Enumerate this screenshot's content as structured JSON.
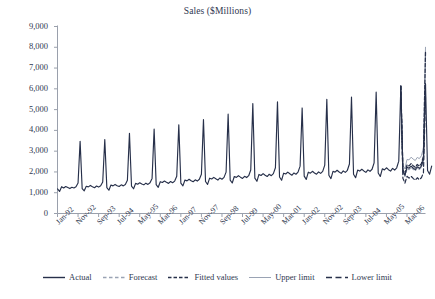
{
  "chart_data": {
    "type": "line",
    "title": "Sales ($Millions)",
    "xlabel": "",
    "ylabel": "",
    "ylim": [
      0,
      9000
    ],
    "ytick_step": 1000,
    "grid": false,
    "legend_position": "bottom",
    "yticks": [
      "0",
      "1,000",
      "2,000",
      "3,000",
      "4,000",
      "5,000",
      "6,000",
      "7,000",
      "8,000",
      "9,000"
    ],
    "ytick_values": [
      0,
      1000,
      2000,
      3000,
      4000,
      5000,
      6000,
      7000,
      8000,
      9000
    ],
    "xticks": [
      "Jan-92",
      "Nov-92",
      "Sep-93",
      "Jul-94",
      "May-95",
      "Mar-96",
      "Jan-97",
      "Nov-97",
      "Sep-98",
      "Jul-99",
      "May-00",
      "Mar-01",
      "Jan-02",
      "Nov-02",
      "Sep-03",
      "Jul-04",
      "May-05",
      "Mar-06"
    ],
    "xtick_indices": [
      0,
      10,
      20,
      30,
      40,
      50,
      60,
      70,
      80,
      90,
      100,
      110,
      120,
      130,
      140,
      150,
      160,
      170
    ],
    "x_start_label": "Jan-92",
    "x_end_label": "Mar-06",
    "forecast_start_index": 168,
    "n_points": 180,
    "colors": {
      "actual": "#27304a",
      "forecast": "#9aa3b4",
      "fitted": "#27304a",
      "upper_limit": "#9aa3b4",
      "lower_limit": "#27304a",
      "axis": "#9aa0ac",
      "text": "#2f3850",
      "background": "#ffffff"
    },
    "legend": [
      {
        "label": "Actual",
        "style": "solid",
        "color": "#27304a",
        "width": 1.4
      },
      {
        "label": "Forecast",
        "style": "dashed-light",
        "color": "#9aa3b4",
        "width": 1.3
      },
      {
        "label": "Fitted values",
        "style": "dashed-dark",
        "color": "#27304a",
        "width": 1.6
      },
      {
        "label": "Upper limit",
        "style": "solid-light",
        "color": "#9aa3b4",
        "width": 1.0
      },
      {
        "label": "Lower limit",
        "style": "dashed-long",
        "color": "#27304a",
        "width": 1.6
      }
    ],
    "series": [
      {
        "name": "Actual",
        "values": [
          1180,
          1060,
          1290,
          1230,
          1300,
          1250,
          1200,
          1260,
          1230,
          1290,
          1470,
          3470,
          1200,
          1090,
          1310,
          1280,
          1350,
          1290,
          1240,
          1320,
          1270,
          1340,
          1520,
          3560,
          1250,
          1120,
          1370,
          1330,
          1400,
          1340,
          1300,
          1380,
          1330,
          1400,
          1600,
          3860,
          1320,
          1190,
          1450,
          1410,
          1480,
          1420,
          1380,
          1460,
          1400,
          1480,
          1690,
          4060,
          1390,
          1260,
          1530,
          1490,
          1560,
          1500,
          1450,
          1540,
          1480,
          1560,
          1790,
          4270,
          1460,
          1330,
          1610,
          1570,
          1650,
          1580,
          1530,
          1620,
          1560,
          1650,
          1890,
          4520,
          1540,
          1400,
          1700,
          1660,
          1740,
          1670,
          1610,
          1710,
          1650,
          1740,
          1990,
          4780,
          1610,
          1470,
          1780,
          1740,
          1820,
          1750,
          1690,
          1790,
          1730,
          1820,
          2090,
          5290,
          1700,
          1550,
          1880,
          1830,
          1920,
          1840,
          1780,
          1890,
          1820,
          1920,
          2200,
          5380,
          1760,
          1600,
          1940,
          1900,
          1990,
          1910,
          1840,
          1950,
          1890,
          1990,
          2280,
          5080,
          1800,
          1640,
          1990,
          1940,
          2030,
          1950,
          1890,
          2000,
          1930,
          2030,
          2330,
          5500,
          1840,
          1680,
          2030,
          1990,
          2080,
          2000,
          1930,
          2050,
          1980,
          2080,
          2380,
          5600,
          1890,
          1720,
          2090,
          2040,
          2130,
          2050,
          1980,
          2100,
          2030,
          2130,
          2440,
          5840,
          1950,
          1780,
          2150,
          2100,
          2200,
          2110,
          2040,
          2170,
          2090,
          2200,
          2520,
          6130,
          2020,
          1840,
          2230,
          2180,
          2280,
          2190,
          2110,
          2250,
          2170,
          2280,
          2610,
          6250,
          2070,
          1890,
          2280
        ]
      },
      {
        "name": "Forecast",
        "start_index": 168,
        "values": [
          1950,
          1780,
          2150,
          2110,
          2220,
          2130,
          2060,
          2190,
          2120,
          2230,
          2550,
          6200
        ]
      },
      {
        "name": "Fitted values",
        "start_index": 168,
        "values": [
          2100,
          1910,
          2330,
          2290,
          2400,
          2300,
          2220,
          2360,
          2280,
          2400,
          2750,
          7780
        ]
      },
      {
        "name": "Upper limit",
        "start_index": 168,
        "values": [
          2320,
          2150,
          2600,
          2580,
          2710,
          2620,
          2550,
          2700,
          2640,
          2780,
          3160,
          8000
        ]
      },
      {
        "name": "Lower limit",
        "start_index": 168,
        "values": [
          1700,
          1460,
          1790,
          1700,
          1790,
          1690,
          1600,
          1720,
          1630,
          1720,
          1960,
          5600
        ]
      }
    ]
  }
}
